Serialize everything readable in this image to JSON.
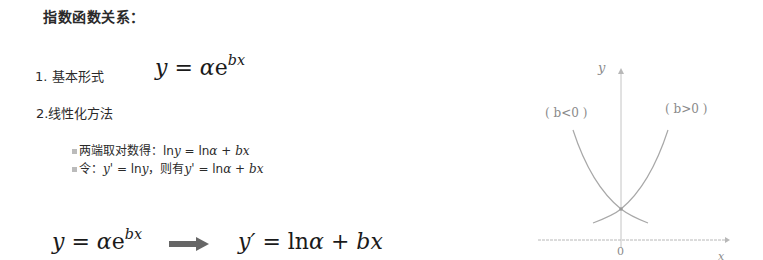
{
  "title": "指数函数关系：",
  "section1": {
    "label": "1. 基本形式",
    "formula": {
      "lhs": "y",
      "eq": " = ",
      "coef": "α",
      "base": "e",
      "exp": "bx"
    }
  },
  "section2": {
    "label": "2.线性化方法",
    "bullets": [
      {
        "prefix": "两端取对数得：",
        "math": "ln",
        "var": "y",
        "rest": " = ln",
        "alpha": "α",
        "plus": " + ",
        "bx": "bx"
      },
      {
        "prefix": "令：",
        "yp": "y'",
        "eq": " = ln",
        "y": "y",
        "mid": "，则有",
        "yp2": "y'",
        "eq2": " = ln",
        "alpha": "α",
        "plus": " + ",
        "bx": "bx"
      }
    ]
  },
  "transform": {
    "left": {
      "lhs": "y",
      "eq": " = ",
      "coef": "α",
      "base": "e",
      "exp": "bx"
    },
    "arrow": "arrow-right",
    "right": {
      "lhs": "y′",
      "eq": " = ln",
      "coef": "α",
      "plus": " + ",
      "bx": "bx"
    }
  },
  "graph": {
    "y_axis_label": "y",
    "x_axis_label": "x",
    "origin_label": "0",
    "curve_left_label": "( b<0 )",
    "curve_right_label": "( b>0 )",
    "line_color": "#b0b0b0",
    "text_color": "#8a8a8a"
  }
}
